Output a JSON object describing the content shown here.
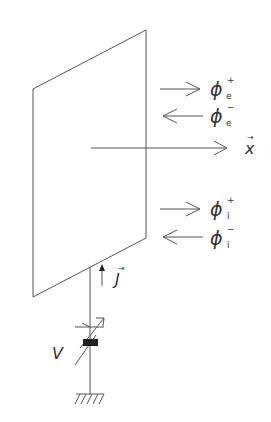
{
  "diagram": {
    "type": "membrane-flux-schematic",
    "colors": {
      "line": "#555555",
      "text": "#333333",
      "background": "#ffffff",
      "block": "#222222"
    },
    "fluxes": [
      {
        "id": "phi_e_plus",
        "symbol": "ϕ",
        "superscript": "+",
        "subscript": "e",
        "direction": "right"
      },
      {
        "id": "phi_e_minus",
        "symbol": "ϕ",
        "superscript": "−",
        "subscript": "e",
        "direction": "left"
      },
      {
        "id": "phi_i_plus",
        "symbol": "ϕ",
        "superscript": "+",
        "subscript": "i",
        "direction": "right"
      },
      {
        "id": "phi_i_minus",
        "symbol": "ϕ",
        "superscript": "−",
        "subscript": "i",
        "direction": "left"
      }
    ],
    "axis": {
      "label": "x",
      "vector_mark": "→",
      "direction": "right"
    },
    "current": {
      "label": "J",
      "vector_mark": "→",
      "direction": "up"
    },
    "voltage": {
      "label": "V"
    },
    "ground": {
      "label": ""
    }
  }
}
